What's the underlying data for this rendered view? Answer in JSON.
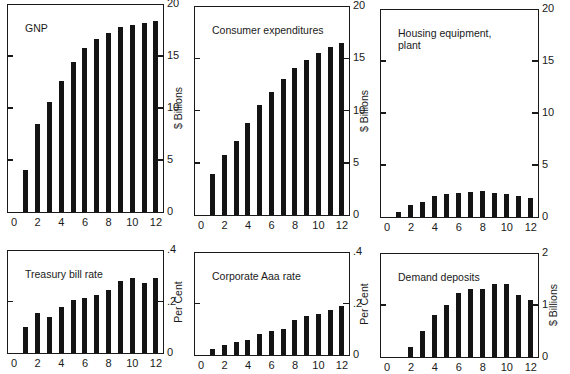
{
  "chart_data": [
    {
      "type": "bar",
      "title": "GNP",
      "xlabel": "",
      "ylabel": "$ Billions",
      "x": [
        1,
        2,
        3,
        4,
        5,
        6,
        7,
        8,
        9,
        10,
        11,
        12
      ],
      "values": [
        4.0,
        8.5,
        10.6,
        12.6,
        14.4,
        15.8,
        16.6,
        17.2,
        17.8,
        18.0,
        18.2,
        18.4
      ],
      "xticks": [
        "0",
        "2",
        "4",
        "6",
        "8",
        "10",
        "12"
      ],
      "yticks": [
        "0",
        "5",
        "10",
        "15",
        "20"
      ],
      "ylim": [
        0,
        20
      ],
      "xlim": [
        0,
        12
      ],
      "grid": false
    },
    {
      "type": "bar",
      "title": "Consumer expenditures",
      "xlabel": "",
      "ylabel": "$ Billions",
      "x": [
        1,
        2,
        3,
        4,
        5,
        6,
        7,
        8,
        9,
        10,
        11,
        12
      ],
      "values": [
        3.9,
        5.7,
        7.1,
        8.8,
        10.5,
        11.8,
        13.0,
        14.1,
        14.8,
        15.5,
        16.1,
        16.5
      ],
      "xticks": [
        "0",
        "2",
        "4",
        "6",
        "8",
        "10",
        "12"
      ],
      "yticks": [
        "0",
        "5",
        "10",
        "15",
        "20"
      ],
      "ylim": [
        0,
        20
      ],
      "xlim": [
        0,
        12
      ],
      "grid": false
    },
    {
      "type": "bar",
      "title": "Housing equipment,\nplant",
      "xlabel": "",
      "ylabel": "$ Billions",
      "x": [
        1,
        2,
        3,
        4,
        5,
        6,
        7,
        8,
        9,
        10,
        11,
        12
      ],
      "values": [
        0.5,
        1.2,
        1.4,
        2.0,
        2.2,
        2.3,
        2.4,
        2.5,
        2.3,
        2.2,
        2.0,
        1.8
      ],
      "xticks": [
        "0",
        "2",
        "4",
        "6",
        "8",
        "10",
        "12"
      ],
      "yticks": [
        "0",
        "5",
        "10",
        "15",
        "20"
      ],
      "ylim": [
        0,
        20
      ],
      "xlim": [
        0,
        12
      ],
      "grid": false
    },
    {
      "type": "bar",
      "title": "Treasury bill rate",
      "xlabel": "",
      "ylabel": "Per Cent",
      "x": [
        1,
        2,
        3,
        4,
        5,
        6,
        7,
        8,
        9,
        10,
        11,
        12
      ],
      "values": [
        0.1,
        0.155,
        0.14,
        0.18,
        0.205,
        0.215,
        0.225,
        0.245,
        0.28,
        0.29,
        0.27,
        0.29
      ],
      "xticks": [
        "0",
        "2",
        "4",
        "6",
        "8",
        "10",
        "12"
      ],
      "yticks": [
        "0",
        ".2",
        ".4"
      ],
      "ylim": [
        0,
        0.4
      ],
      "xlim": [
        0,
        12
      ],
      "grid": false
    },
    {
      "type": "bar",
      "title": "Corporate Aaa rate",
      "xlabel": "",
      "ylabel": "Per Cent",
      "x": [
        1,
        2,
        3,
        4,
        5,
        6,
        7,
        8,
        9,
        10,
        11,
        12
      ],
      "values": [
        0.025,
        0.04,
        0.05,
        0.06,
        0.08,
        0.095,
        0.1,
        0.135,
        0.15,
        0.16,
        0.175,
        0.19
      ],
      "xticks": [
        "0",
        "2",
        "4",
        "6",
        "8",
        "10",
        "12"
      ],
      "yticks": [
        "0",
        ".2",
        ".4"
      ],
      "ylim": [
        0,
        0.4
      ],
      "xlim": [
        0,
        12
      ],
      "grid": false
    },
    {
      "type": "bar",
      "title": "Demand deposits",
      "xlabel": "",
      "ylabel": "$ Billions",
      "x": [
        1,
        2,
        3,
        4,
        5,
        6,
        7,
        8,
        9,
        10,
        11,
        12
      ],
      "values": [
        0,
        0.2,
        0.5,
        0.8,
        1.0,
        1.23,
        1.3,
        1.3,
        1.4,
        1.4,
        1.2,
        1.1
      ],
      "xticks": [
        "0",
        "2",
        "4",
        "6",
        "8",
        "10",
        "12"
      ],
      "yticks": [
        "0",
        "1",
        "2"
      ],
      "ylim": [
        0,
        2
      ],
      "xlim": [
        0,
        12
      ],
      "grid": false
    }
  ],
  "panels": [
    {
      "title": "GNP",
      "y_axis_title": "$ Billions"
    },
    {
      "title": "Consumer expenditures",
      "y_axis_title": "$ Billions"
    },
    {
      "title": "Housing equipment,\nplant",
      "y_axis_title": ""
    },
    {
      "title": "Treasury bill rate",
      "y_axis_title": "Per Cent"
    },
    {
      "title": "Corporate Aaa rate",
      "y_axis_title": "Per Cent"
    },
    {
      "title": "Demand deposits",
      "y_axis_title": "$ Billions"
    }
  ],
  "layout": [
    {
      "left": 7,
      "top": 4,
      "right": 164,
      "base": 212
    },
    {
      "left": 194,
      "top": 6,
      "right": 350,
      "base": 215
    },
    {
      "left": 380,
      "top": 9,
      "right": 539,
      "base": 217
    },
    {
      "left": 7,
      "top": 250,
      "right": 164,
      "base": 353
    },
    {
      "left": 194,
      "top": 252,
      "right": 350,
      "base": 355
    },
    {
      "left": 380,
      "top": 253,
      "right": 539,
      "base": 357
    }
  ],
  "colors": {
    "ink": "#141414",
    "paper": "#ffffff"
  }
}
